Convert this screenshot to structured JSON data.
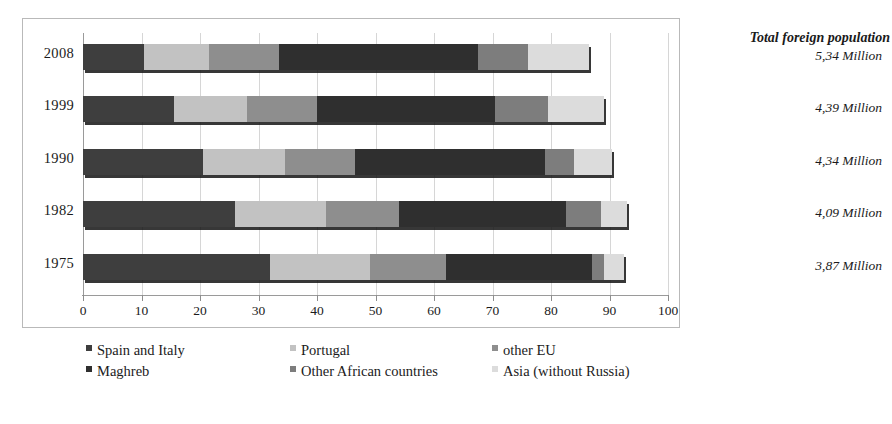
{
  "chart_data": {
    "type": "bar",
    "orientation": "horizontal",
    "stacked": true,
    "title": "",
    "xlabel": "",
    "ylabel": "",
    "xlim": [
      0,
      100
    ],
    "xticks": [
      "0",
      "10",
      "20",
      "30",
      "40",
      "50",
      "60",
      "70",
      "80",
      "90",
      "100"
    ],
    "grid": true,
    "legend_position": "bottom",
    "categories": [
      "2008",
      "1999",
      "1990",
      "1982",
      "1975"
    ],
    "series": [
      {
        "name": "Spain and Italy",
        "color": "#3e3e3e",
        "values": [
          10.5,
          15.5,
          20.5,
          26.0,
          32.0
        ]
      },
      {
        "name": "Portugal",
        "color": "#c2c2c2",
        "values": [
          11.0,
          12.5,
          14.0,
          15.5,
          17.0
        ]
      },
      {
        "name": "other EU",
        "color": "#8e8e8e",
        "values": [
          12.0,
          12.0,
          12.0,
          12.5,
          13.0
        ]
      },
      {
        "name": "Maghreb",
        "color": "#2f2f2f",
        "values": [
          34.0,
          30.5,
          32.5,
          28.5,
          25.0
        ]
      },
      {
        "name": "Other African countries",
        "color": "#7d7d7d",
        "values": [
          8.5,
          9.0,
          5.0,
          6.0,
          2.0
        ]
      },
      {
        "name": "Asia (without Russia)",
        "color": "#dcdcdc",
        "values": [
          10.5,
          9.5,
          6.5,
          4.5,
          3.5
        ]
      }
    ],
    "totals_label": "Total foreign population",
    "totals": [
      "5,34 Million",
      "4,39 Million",
      "4,34 Million",
      "4,09 Million",
      "3,87 Million"
    ]
  },
  "legend": {
    "items": [
      {
        "label": "Spain and Italy",
        "color": "#3e3e3e"
      },
      {
        "label": "Portugal",
        "color": "#c2c2c2"
      },
      {
        "label": "other EU",
        "color": "#8e8e8e"
      },
      {
        "label": "Maghreb",
        "color": "#2f2f2f"
      },
      {
        "label": "Other African countries",
        "color": "#7d7d7d"
      },
      {
        "label": "Asia (without Russia)",
        "color": "#dcdcdc"
      }
    ]
  }
}
